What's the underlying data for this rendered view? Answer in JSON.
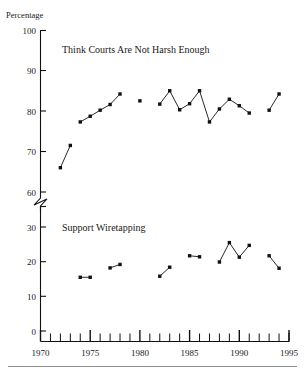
{
  "chart_data": {
    "type": "line",
    "title": "",
    "xlabel": "",
    "ylabel": "Percentage",
    "axis_break": true,
    "grid": false,
    "legend_position": "inline-annotation",
    "xlim": [
      1970,
      1995
    ],
    "x_tick_labels": [
      "1970",
      "1975",
      "1980",
      "1985",
      "1990",
      "1995"
    ],
    "x_tick_values": [
      1970,
      1975,
      1980,
      1985,
      1990,
      1995
    ],
    "x_minor_ticks": [
      1970,
      1971,
      1972,
      1973,
      1974,
      1975,
      1976,
      1977,
      1978,
      1979,
      1980,
      1981,
      1982,
      1983,
      1984,
      1985,
      1986,
      1987,
      1988,
      1989,
      1990,
      1991,
      1992,
      1993,
      1994,
      1995
    ],
    "panels": [
      {
        "name": "upper",
        "ylim": [
          60,
          100
        ],
        "y_tick_labels": [
          "60",
          "70",
          "80",
          "90",
          "100"
        ],
        "y_tick_values": [
          60,
          70,
          80,
          90,
          100
        ],
        "annotation": "Think Courts Are Not Harsh Enough",
        "series": [
          {
            "name": "Think Courts Are Not Harsh Enough",
            "segments": [
              {
                "x": [
                  1972,
                  1973
                ],
                "y": [
                  66.0,
                  71.5
                ]
              },
              {
                "x": [
                  1974,
                  1975,
                  1976,
                  1977,
                  1978
                ],
                "y": [
                  77.3,
                  78.7,
                  80.2,
                  81.6,
                  84.2
                ]
              },
              {
                "x": [
                  1980
                ],
                "y": [
                  82.5
                ]
              },
              {
                "x": [
                  1982,
                  1983,
                  1984,
                  1985,
                  1986,
                  1987,
                  1988,
                  1989,
                  1990,
                  1991
                ],
                "y": [
                  81.7,
                  85.0,
                  80.3,
                  81.8,
                  85.0,
                  77.3,
                  80.5,
                  82.9,
                  81.3,
                  79.5
                ]
              },
              {
                "x": [
                  1993,
                  1994
                ],
                "y": [
                  80.2,
                  84.2
                ]
              }
            ]
          }
        ]
      },
      {
        "name": "lower",
        "ylim": [
          0,
          30
        ],
        "y_tick_labels": [
          "0",
          "10",
          "20",
          "30"
        ],
        "y_tick_values": [
          0,
          10,
          20,
          30
        ],
        "annotation": "Support Wiretapping",
        "series": [
          {
            "name": "Support Wiretapping",
            "segments": [
              {
                "x": [
                  1974,
                  1975
                ],
                "y": [
                  15.5,
                  15.5
                ]
              },
              {
                "x": [
                  1977,
                  1978
                ],
                "y": [
                  18.2,
                  19.2
                ]
              },
              {
                "x": [
                  1982,
                  1983
                ],
                "y": [
                  15.8,
                  18.4
                ]
              },
              {
                "x": [
                  1985,
                  1986
                ],
                "y": [
                  21.7,
                  21.4
                ]
              },
              {
                "x": [
                  1988,
                  1989,
                  1990,
                  1991
                ],
                "y": [
                  19.9,
                  25.5,
                  21.3,
                  24.7
                ]
              },
              {
                "x": [
                  1993,
                  1994
                ],
                "y": [
                  21.7,
                  18.1
                ]
              }
            ]
          }
        ]
      }
    ],
    "colors": {
      "line": "#111111",
      "marker": "#111111",
      "axis": "#111111",
      "text": "#1a1a1a",
      "footer_rule": "#8e8e8e"
    }
  },
  "labels": {
    "y_axis_title": "Percentage",
    "upper_annotation": "Think Courts Are Not Harsh Enough",
    "lower_annotation": "Support Wiretapping"
  }
}
